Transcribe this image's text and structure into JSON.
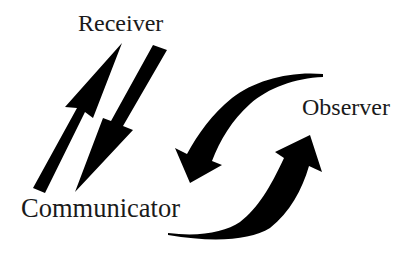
{
  "diagram": {
    "title": "",
    "nodes": [
      {
        "id": "receiver",
        "label": "Receiver"
      },
      {
        "id": "communicator",
        "label": "Communicator"
      },
      {
        "id": "observer",
        "label": "Observer"
      }
    ],
    "edges": [
      {
        "from": "communicator",
        "to": "receiver",
        "style": "straight-arrow"
      },
      {
        "from": "receiver",
        "to": "communicator",
        "style": "straight-arrow"
      },
      {
        "from": "observer",
        "to": "communicator",
        "style": "curved-arrow"
      },
      {
        "from": "communicator",
        "to": "observer",
        "style": "curved-arrow"
      }
    ],
    "colors": {
      "arrow": "#000000",
      "text": "#1a1a1a",
      "background": "#ffffff"
    }
  }
}
